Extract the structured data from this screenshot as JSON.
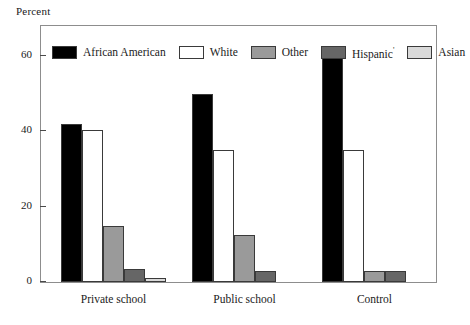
{
  "chart_data": {
    "type": "bar",
    "title": "",
    "subtitle": "",
    "xlabel": "",
    "ylabel": "Percent",
    "ylim": [
      0,
      68
    ],
    "yticks": [
      0,
      20,
      40,
      60
    ],
    "ytick_labels": [
      "0",
      "20",
      "40",
      "60"
    ],
    "grid": false,
    "legend_position": "top-left-inside",
    "categories": [
      "Private school",
      "Public school",
      "Control"
    ],
    "series": [
      {
        "name": "African American",
        "color": "#000000",
        "values": [
          42,
          50,
          60
        ]
      },
      {
        "name": "White",
        "color": "#ffffff",
        "values": [
          40.5,
          35,
          35
        ]
      },
      {
        "name": "Other",
        "color": "#9a9a9a",
        "values": [
          15,
          12.5,
          3
        ]
      },
      {
        "name": "Hispanic",
        "name_suffix": "'",
        "color": "#666666",
        "values": [
          3.5,
          3,
          3
        ]
      },
      {
        "name": "Asian",
        "color": "#d9d9d9",
        "values": [
          1,
          0,
          0
        ]
      }
    ]
  },
  "legend": {
    "items": [
      {
        "label": "African American",
        "suffix": ""
      },
      {
        "label": "White",
        "suffix": ""
      },
      {
        "label": "Other",
        "suffix": ""
      },
      {
        "label": "Hispanic",
        "suffix": "'"
      },
      {
        "label": "Asian",
        "suffix": ""
      }
    ]
  },
  "axes": {
    "y_title": "Percent",
    "y_tick_labels": [
      "60",
      "40",
      "20",
      "0"
    ],
    "x_tick_labels": [
      "Private school",
      "Public school",
      "Control"
    ]
  }
}
